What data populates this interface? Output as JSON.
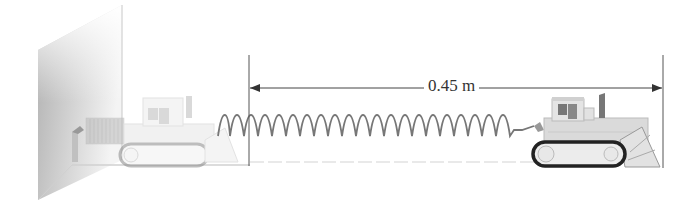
{
  "diagram": {
    "dimension": {
      "label": "0.45 m",
      "value": 0.45,
      "unit": "m"
    },
    "objects": [
      {
        "name": "wall",
        "description": "shaded wall on left"
      },
      {
        "name": "bulldozer-ghost",
        "description": "faded bulldozer at initial (spring relaxed) position"
      },
      {
        "name": "spring",
        "description": "coil spring stretched between wall and bulldozer"
      },
      {
        "name": "bulldozer",
        "description": "bulldozer at stretched position"
      }
    ],
    "colors": {
      "line": "#555555",
      "spring": "#777777",
      "wall_dark": "#b5b5b5",
      "ghost": "#d8d8d8",
      "bulldozer_body": "#dcdcdc",
      "track": "#333333"
    }
  }
}
